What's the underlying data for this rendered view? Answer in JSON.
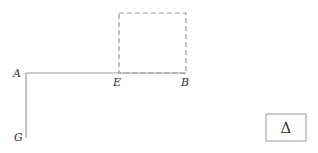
{
  "diagram": {
    "points": {
      "A": {
        "label": "A",
        "x": 26,
        "y": 73
      },
      "E": {
        "label": "E",
        "x": 119,
        "y": 73
      },
      "B": {
        "label": "B",
        "x": 186,
        "y": 73
      },
      "G": {
        "label": "G",
        "x": 26,
        "y": 138
      }
    },
    "segments": [
      {
        "from": "A",
        "to": "B",
        "style": "solid"
      },
      {
        "from": "A",
        "to": "G",
        "style": "solid"
      }
    ],
    "dashed_square": {
      "x": 119,
      "y": 13,
      "width": 67,
      "height": 60
    },
    "symbol_box": {
      "symbol": "Δ",
      "x": 266,
      "y": 114,
      "width": 40,
      "height": 27
    },
    "colors": {
      "line": "#999999",
      "text": "#333333"
    }
  }
}
